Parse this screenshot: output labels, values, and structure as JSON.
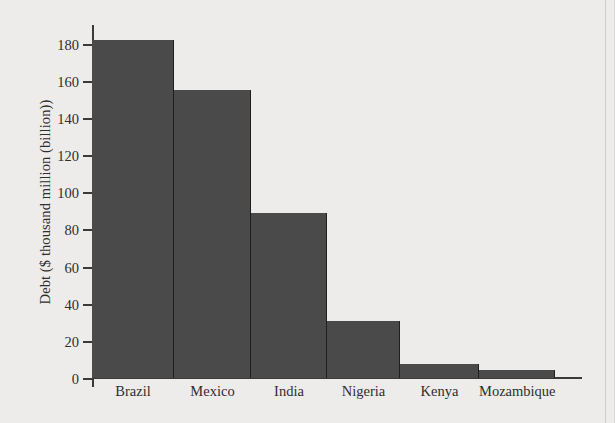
{
  "chart_data": {
    "type": "bar",
    "title": "",
    "subtitle": "",
    "xlabel": "",
    "ylabel": "Debt ($ thousand million (billion))",
    "categories": [
      "Brazil",
      "Mexico",
      "India",
      "Nigeria",
      "Kenya",
      "Mozambique"
    ],
    "values": [
      182,
      155,
      89,
      30.5,
      7.5,
      4.5
    ],
    "series": [
      {
        "name": "Debt",
        "values": [
          182,
          155,
          89,
          30.5,
          7.5,
          4.5
        ]
      }
    ],
    "ylim": [
      0,
      190
    ],
    "y_ticks": [
      0,
      20,
      40,
      60,
      80,
      100,
      120,
      140,
      160,
      180
    ],
    "y_tick_labels": [
      "0",
      "20",
      "40",
      "60",
      "80",
      "100",
      "120",
      "140",
      "160",
      "180"
    ],
    "grid": false,
    "legend": null,
    "legend_position": "none",
    "annotations": [],
    "bar_color": "#4a4a4a",
    "axis_color": "#3a3a3a",
    "background_color": "#edecea",
    "text_color": "#2e2e2e"
  }
}
